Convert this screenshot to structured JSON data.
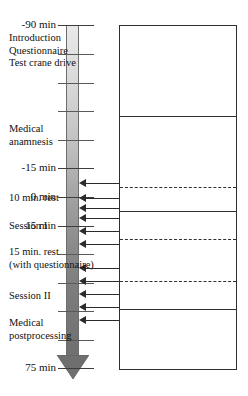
{
  "figure": {
    "axis": {
      "name": "time-axis",
      "unit": "min",
      "direction": "top-to-bottom",
      "start_value": -90,
      "end_value": 75,
      "tick_interval_minutes": 15,
      "labels": [
        {
          "text": "-90 min",
          "value": -90,
          "y": 25
        },
        {
          "text": "-15 min",
          "value": -15,
          "y": 168
        },
        {
          "text": "0 min",
          "value": 0,
          "y": 197
        },
        {
          "text": "15 min",
          "value": 15,
          "y": 226
        },
        {
          "text": "75 min",
          "value": 75,
          "y": 368
        }
      ],
      "ticks": [
        {
          "value": -90,
          "y": 25,
          "labeled": true
        },
        {
          "value": -75,
          "y": 54,
          "labeled": false
        },
        {
          "value": -60,
          "y": 83,
          "labeled": false
        },
        {
          "value": -45,
          "y": 111,
          "labeled": false
        },
        {
          "value": -30,
          "y": 140,
          "labeled": false
        },
        {
          "value": -15,
          "y": 168,
          "labeled": true
        },
        {
          "value": 0,
          "y": 197,
          "labeled": true
        },
        {
          "value": 15,
          "y": 226,
          "labeled": true
        },
        {
          "value": 30,
          "y": 254,
          "labeled": false
        },
        {
          "value": 45,
          "y": 283,
          "labeled": false
        },
        {
          "value": 60,
          "y": 311,
          "labeled": false
        },
        {
          "value": 75,
          "y": 340,
          "labeled": false
        },
        {
          "value": 90,
          "y": 368,
          "labeled": true
        }
      ]
    },
    "phases": [
      {
        "id": "introduction",
        "text": "Introduction\nQuestionnaire\nTest crane drive",
        "top": 25,
        "bottom": 117,
        "border_top": "solid",
        "border_bottom": "solid"
      },
      {
        "id": "medical-anamnesis",
        "text": "Medical\nanamnesis",
        "top": 117,
        "bottom": 188,
        "border_top": "solid",
        "border_bottom": "dashed"
      },
      {
        "id": "rest-10min",
        "text": "10 min. rest",
        "top": 188,
        "bottom": 212,
        "border_top": "dashed",
        "border_bottom": "solid"
      },
      {
        "id": "session-1",
        "text": "Session I",
        "top": 212,
        "bottom": 240,
        "border_top": "solid",
        "border_bottom": "dashed"
      },
      {
        "id": "rest-15min",
        "text": "15 min. rest\n(with questionnaire)",
        "top": 240,
        "bottom": 282,
        "border_top": "dashed",
        "border_bottom": "dashed"
      },
      {
        "id": "session-2",
        "text": "Session II",
        "top": 282,
        "bottom": 310,
        "border_top": "dashed",
        "border_bottom": "solid"
      },
      {
        "id": "medical-postprocessing",
        "text": "Medical\npostprocessing",
        "top": 310,
        "bottom": 370,
        "border_top": "solid",
        "border_bottom": "solid"
      }
    ],
    "connectors": [
      {
        "y": 183,
        "from_phase": "rest-10min"
      },
      {
        "y": 198,
        "from_phase": "rest-10min"
      },
      {
        "y": 208,
        "from_phase": "session-1"
      },
      {
        "y": 218,
        "from_phase": "session-1"
      },
      {
        "y": 231,
        "from_phase": "session-1"
      },
      {
        "y": 244,
        "from_phase": "rest-15min"
      },
      {
        "y": 268,
        "from_phase": "rest-15min"
      },
      {
        "y": 281,
        "from_phase": "session-2"
      },
      {
        "y": 294,
        "from_phase": "session-2"
      },
      {
        "y": 307,
        "from_phase": "session-2"
      },
      {
        "y": 320,
        "from_phase": "medical-postprocessing"
      }
    ],
    "colors": {
      "arrow_top": "#e9e9e9",
      "arrow_bottom": "#6f6f6f",
      "line": "#2f2f2f",
      "text": "#111111"
    }
  }
}
